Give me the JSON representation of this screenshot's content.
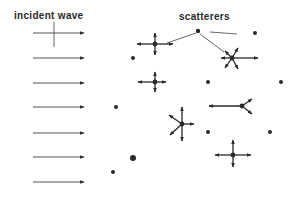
{
  "diagram": {
    "labels": {
      "incident": "incident wave",
      "scatterers": "scatterers"
    },
    "colors": {
      "ink": "#2a2a2a",
      "line": "#555555",
      "background": "#ffffff"
    },
    "incident_arrows": [
      {
        "x1": 33,
        "x2": 84,
        "y": 33
      },
      {
        "x1": 33,
        "x2": 84,
        "y": 58
      },
      {
        "x1": 33,
        "x2": 84,
        "y": 83
      },
      {
        "x1": 33,
        "x2": 84,
        "y": 107
      },
      {
        "x1": 33,
        "x2": 84,
        "y": 133
      },
      {
        "x1": 33,
        "x2": 84,
        "y": 157
      },
      {
        "x1": 33,
        "x2": 84,
        "y": 182
      }
    ],
    "incident_label_pointer": {
      "x": 54,
      "y1": 22,
      "y2": 47
    },
    "passive_scatterers": [
      {
        "x": 198,
        "y": 31,
        "r": 2.2
      },
      {
        "x": 255,
        "y": 33,
        "r": 2
      },
      {
        "x": 133,
        "y": 58,
        "r": 2
      },
      {
        "x": 208,
        "y": 82,
        "r": 2
      },
      {
        "x": 281,
        "y": 82,
        "r": 2
      },
      {
        "x": 116,
        "y": 107,
        "r": 2
      },
      {
        "x": 208,
        "y": 132,
        "r": 2
      },
      {
        "x": 270,
        "y": 132,
        "r": 2
      },
      {
        "x": 133,
        "y": 158,
        "r": 3
      },
      {
        "x": 113,
        "y": 172,
        "r": 2
      }
    ],
    "scatterers_label_pointers": [
      {
        "x1": 196,
        "y1": 33,
        "x2": 167,
        "y2": 43
      },
      {
        "x1": 210,
        "y1": 32,
        "x2": 237,
        "y2": 34
      },
      {
        "x1": 200,
        "y1": 34,
        "x2": 224,
        "y2": 52
      }
    ],
    "active_scatterers": [
      {
        "x": 155,
        "y": 44,
        "arrows": [
          [
            -18,
            0
          ],
          [
            18,
            0
          ],
          [
            0,
            -11
          ],
          [
            0,
            11
          ]
        ]
      },
      {
        "x": 232,
        "y": 58,
        "arrows": [
          [
            26,
            0
          ],
          [
            -11,
            0
          ],
          [
            -7,
            -7
          ],
          [
            6,
            -10
          ],
          [
            -7,
            10
          ],
          [
            6,
            11
          ]
        ]
      },
      {
        "x": 155,
        "y": 82,
        "arrows": [
          [
            -17,
            0
          ],
          [
            11,
            0
          ],
          [
            0,
            -10
          ],
          [
            0,
            10
          ]
        ]
      },
      {
        "x": 242,
        "y": 106,
        "arrows": [
          [
            -33,
            0
          ],
          [
            10,
            -7
          ],
          [
            10,
            8
          ]
        ]
      },
      {
        "x": 182,
        "y": 124,
        "arrows": [
          [
            0,
            -17
          ],
          [
            0,
            17
          ],
          [
            12,
            0
          ],
          [
            -13,
            -9
          ],
          [
            -12,
            11
          ]
        ]
      },
      {
        "x": 233,
        "y": 155,
        "arrows": [
          [
            -18,
            0
          ],
          [
            18,
            0
          ],
          [
            0,
            -15
          ],
          [
            0,
            12
          ]
        ]
      }
    ]
  }
}
